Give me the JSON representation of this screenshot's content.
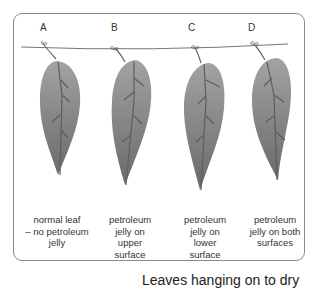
{
  "diagram": {
    "title": "Leaves hanging on to dry",
    "line_color": "#777777",
    "leaf_gradient": [
      "#a0a0a0",
      "#7a7a7a",
      "#6e6e6e"
    ],
    "vein_color": "#5e5e5e",
    "leaves": [
      {
        "letter": "A",
        "caption": [
          "normal leaf",
          "– no petroleum",
          "jelly"
        ]
      },
      {
        "letter": "B",
        "caption": [
          "petroleum",
          "jelly on",
          "upper",
          "surface"
        ]
      },
      {
        "letter": "C",
        "caption": [
          "petroleum",
          "jelly on",
          "lower",
          "surface"
        ]
      },
      {
        "letter": "D",
        "caption": [
          "petroleum",
          "jelly on both",
          "surfaces"
        ]
      }
    ]
  }
}
